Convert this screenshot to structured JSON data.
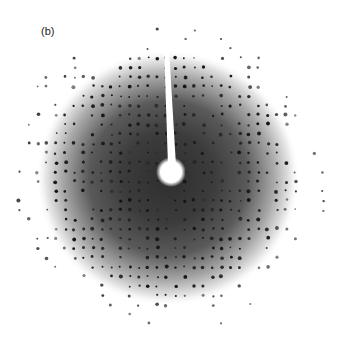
{
  "figure": {
    "panel_label": "(b)",
    "center": {
      "x": 171,
      "y": 172
    },
    "halo_radius": 125,
    "beamstop": {
      "circle_radius": 11,
      "stem_top": {
        "x": 164,
        "y": 14
      }
    },
    "colors": {
      "background": "#ffffff",
      "halo_core": "#3a3a3a",
      "spot": "#1a1a1a",
      "beamstop": "#ffffff"
    }
  }
}
